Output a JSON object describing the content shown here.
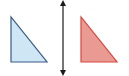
{
  "diagram": {
    "type": "reflection",
    "original_shape": {
      "shape": "right-triangle",
      "fill": "#cfe6f5",
      "stroke": "#3b5a86",
      "points": "11,17 11,62 47,62"
    },
    "reflected_shape": {
      "shape": "right-triangle",
      "fill": "#e99a92",
      "stroke": "#d9473c",
      "points": "81,17 81,62 117,62"
    },
    "mirror_line": {
      "orientation": "vertical",
      "x": 63,
      "y1": 3,
      "y2": 73,
      "color": "#1a1a1a",
      "arrowheads": "both"
    }
  }
}
